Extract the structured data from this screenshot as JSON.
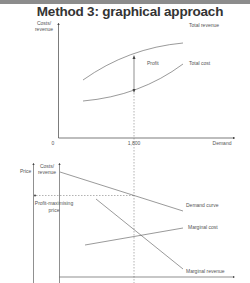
{
  "header": {
    "title": "Method 3: graphical approach"
  },
  "top_graph": {
    "y_axis_label_line1": "Costs/",
    "y_axis_label_line2": "revenue",
    "x_axis_label": "Demand",
    "origin_label": "0",
    "x_tick_label": "1,800",
    "curves": {
      "total_revenue": "Total revenue",
      "total_cost": "Total cost"
    },
    "profit_label": "Profit"
  },
  "bottom_graph": {
    "price_axis_label": "Price",
    "y_axis_label_line1": "Costs/",
    "y_axis_label_line2": "revenue",
    "price_label_line1": "Profit-maximising",
    "price_label_line2": "price",
    "curves": {
      "demand": "Demand curve",
      "marginal_cost": "Marginal cost",
      "marginal_revenue": "Marginal revenue"
    }
  },
  "colors": {
    "topbar": "#8c8c8c",
    "line": "#444444",
    "text": "#555555"
  }
}
